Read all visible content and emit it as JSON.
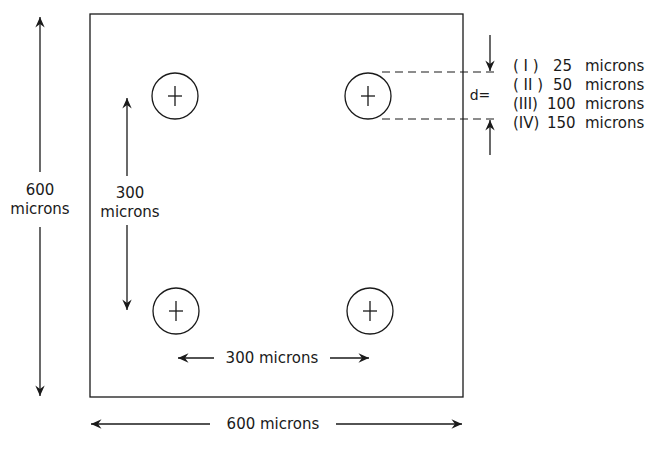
{
  "diagram": {
    "outer_square": {
      "width_label": "600 microns",
      "height_label_value": "600",
      "height_label_unit": "microns"
    },
    "hole_spacing": {
      "vertical_label_value": "300",
      "vertical_label_unit": "microns",
      "horizontal_label": "300 microns"
    },
    "holes": [
      {
        "position": "top-left",
        "marker": "+"
      },
      {
        "position": "top-right",
        "marker": "+"
      },
      {
        "position": "bottom-left",
        "marker": "+"
      },
      {
        "position": "bottom-right",
        "marker": "+"
      }
    ],
    "diameter": {
      "label": "d=",
      "options": [
        {
          "numeral": "( I )",
          "value": "25",
          "unit": "microns"
        },
        {
          "numeral": "( II )",
          "value": "50",
          "unit": "microns"
        },
        {
          "numeral": "(III)",
          "value": "100",
          "unit": "microns"
        },
        {
          "numeral": "(IV)",
          "value": "150",
          "unit": "microns"
        }
      ]
    },
    "colors": {
      "ink": "#1a1a1a",
      "background": "#ffffff"
    }
  }
}
